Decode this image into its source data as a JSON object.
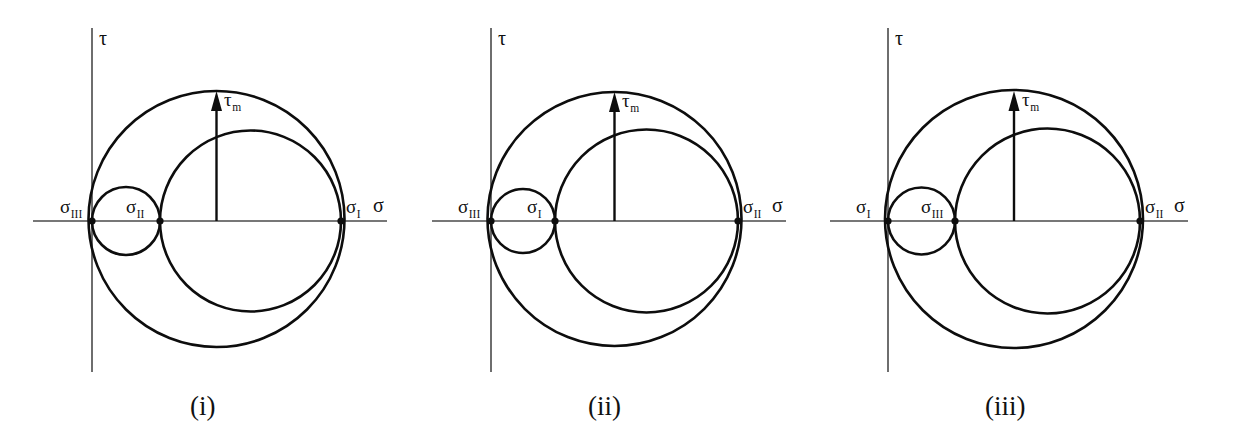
{
  "figure": {
    "background_color": "#ffffff",
    "stroke_color": "#0d0d0d",
    "axis_color": "#4a4a4a"
  },
  "chart_data": {
    "type": "diagram",
    "subtype": "mohr-circles",
    "xlabel": "σ",
    "ylabel": "τ",
    "grid": false,
    "legend": null,
    "panels": [
      {
        "id": "i",
        "caption": "(i)",
        "axis_x_label": "σ",
        "axis_y_label": "τ",
        "tau_label": "τ",
        "tau_sub": "m",
        "points": [
          {
            "name": "sigma-III",
            "symbol": "σ",
            "subscript": "III",
            "x": 92,
            "label_x": 60,
            "label_y": 213
          },
          {
            "name": "sigma-II",
            "symbol": "σ",
            "subscript": "II",
            "x": 160,
            "label_x": 126,
            "label_y": 213
          },
          {
            "name": "sigma-I",
            "symbol": "σ",
            "subscript": "I",
            "x": 341,
            "label_x": 346,
            "label_y": 213
          }
        ],
        "axis_origin_x": 92,
        "axis_y": 221,
        "axis_x_start": 33,
        "axis_x_end": 387,
        "axis_y_top": 28,
        "axis_y_bottom": 372,
        "sigma_axis_label_x": 373,
        "sigma_axis_label_y": 212,
        "tau_axis_label_x": 99,
        "tau_axis_label_y": 45,
        "circles": [
          {
            "name": "large-circle",
            "left": 92,
            "right": 341,
            "cx": 216.5,
            "cy": 219,
            "r": 128
          },
          {
            "name": "medium-circle",
            "left": 160,
            "right": 341,
            "cx": 250.5,
            "cy": 221,
            "r": 90.5
          },
          {
            "name": "small-circle",
            "left": 92,
            "right": 160,
            "cx": 126,
            "cy": 221,
            "r": 34
          }
        ],
        "arrow": {
          "x": 216.5,
          "y_base": 221,
          "y_tip": 91,
          "label_x": 224,
          "label_y": 106
        },
        "caption_x": 190,
        "caption_y": 415
      },
      {
        "id": "ii",
        "caption": "(ii)",
        "axis_x_label": "σ",
        "axis_y_label": "τ",
        "tau_label": "τ",
        "tau_sub": "m",
        "points": [
          {
            "name": "sigma-III",
            "symbol": "σ",
            "subscript": "III",
            "x": 491,
            "label_x": 458,
            "label_y": 213
          },
          {
            "name": "sigma-I",
            "symbol": "σ",
            "subscript": "I",
            "x": 555,
            "label_x": 527,
            "label_y": 213
          },
          {
            "name": "sigma-II",
            "symbol": "σ",
            "subscript": "II",
            "x": 738,
            "label_x": 743,
            "label_y": 213
          }
        ],
        "axis_origin_x": 491,
        "axis_y": 221,
        "axis_x_start": 432,
        "axis_x_end": 786,
        "axis_y_top": 28,
        "axis_y_bottom": 372,
        "sigma_axis_label_x": 772,
        "sigma_axis_label_y": 212,
        "tau_axis_label_x": 498,
        "tau_axis_label_y": 45,
        "circles": [
          {
            "name": "large-circle",
            "left": 491,
            "right": 738,
            "cx": 614.5,
            "cy": 219,
            "r": 127
          },
          {
            "name": "medium-circle",
            "left": 555,
            "right": 738,
            "cx": 646.5,
            "cy": 221,
            "r": 91.5
          },
          {
            "name": "small-circle",
            "left": 491,
            "right": 555,
            "cx": 523,
            "cy": 221,
            "r": 32
          }
        ],
        "arrow": {
          "x": 614.5,
          "y_base": 221,
          "y_tip": 92,
          "label_x": 622,
          "label_y": 107
        },
        "caption_x": 588,
        "caption_y": 415
      },
      {
        "id": "iii",
        "caption": "(iii)",
        "axis_x_label": "σ",
        "axis_y_label": "τ",
        "tau_label": "τ",
        "tau_sub": "m",
        "points": [
          {
            "name": "sigma-I",
            "symbol": "σ",
            "subscript": "I",
            "x": 888,
            "label_x": 856,
            "label_y": 213
          },
          {
            "name": "sigma-III",
            "symbol": "σ",
            "subscript": "III",
            "x": 955,
            "label_x": 921,
            "label_y": 213
          },
          {
            "name": "sigma-II",
            "symbol": "σ",
            "subscript": "II",
            "x": 1140,
            "label_x": 1145,
            "label_y": 213
          }
        ],
        "axis_origin_x": 888,
        "axis_y": 221,
        "axis_x_start": 830,
        "axis_x_end": 1188,
        "axis_y_top": 28,
        "axis_y_bottom": 372,
        "sigma_axis_label_x": 1174,
        "sigma_axis_label_y": 212,
        "tau_axis_label_x": 895,
        "tau_axis_label_y": 45,
        "circles": [
          {
            "name": "large-circle",
            "left": 888,
            "right": 1140,
            "cx": 1014,
            "cy": 219,
            "r": 129
          },
          {
            "name": "medium-circle",
            "left": 955,
            "right": 1140,
            "cx": 1047.5,
            "cy": 221,
            "r": 92.5
          },
          {
            "name": "small-circle",
            "left": 888,
            "right": 955,
            "cx": 921.5,
            "cy": 221,
            "r": 33.5
          }
        ],
        "arrow": {
          "x": 1014,
          "y_base": 221,
          "y_tip": 91,
          "label_x": 1022,
          "label_y": 106
        },
        "caption_x": 985,
        "caption_y": 415
      }
    ]
  }
}
